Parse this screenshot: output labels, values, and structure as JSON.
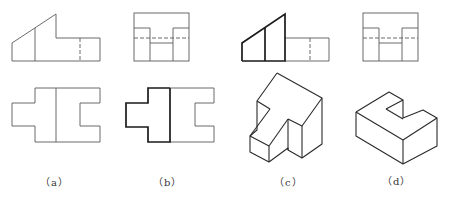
{
  "figure": {
    "panels": [
      {
        "id": "a",
        "label": "（a）",
        "description": "two orthographic views: front and top, with left-side view"
      },
      {
        "id": "b",
        "label": "（b）",
        "description": "side view and top view with left region highlighted"
      },
      {
        "id": "c",
        "label": "（c）",
        "description": "front view with highlighted face and isometric solid"
      },
      {
        "id": "d",
        "label": "（d）",
        "description": "side view and isometric U-shaped block"
      }
    ]
  }
}
